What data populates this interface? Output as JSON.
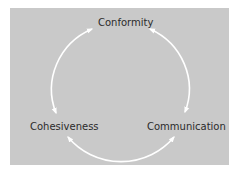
{
  "diagram": {
    "type": "cycle",
    "nodes": [
      {
        "id": "conformity",
        "label": "Conformity",
        "position": "top"
      },
      {
        "id": "cohesiveness",
        "label": "Cohesiveness",
        "position": "left"
      },
      {
        "id": "communication",
        "label": "Communication",
        "position": "right"
      }
    ],
    "edges": [
      {
        "from": "cohesiveness",
        "to": "conformity"
      },
      {
        "from": "communication",
        "to": "conformity"
      },
      {
        "from": "cohesiveness",
        "to": "communication"
      },
      {
        "from": "communication",
        "to": "cohesiveness"
      }
    ],
    "colors": {
      "panel": "#c9c9c9",
      "arrows": "#ffffff",
      "text": "#2b2b2b"
    }
  }
}
